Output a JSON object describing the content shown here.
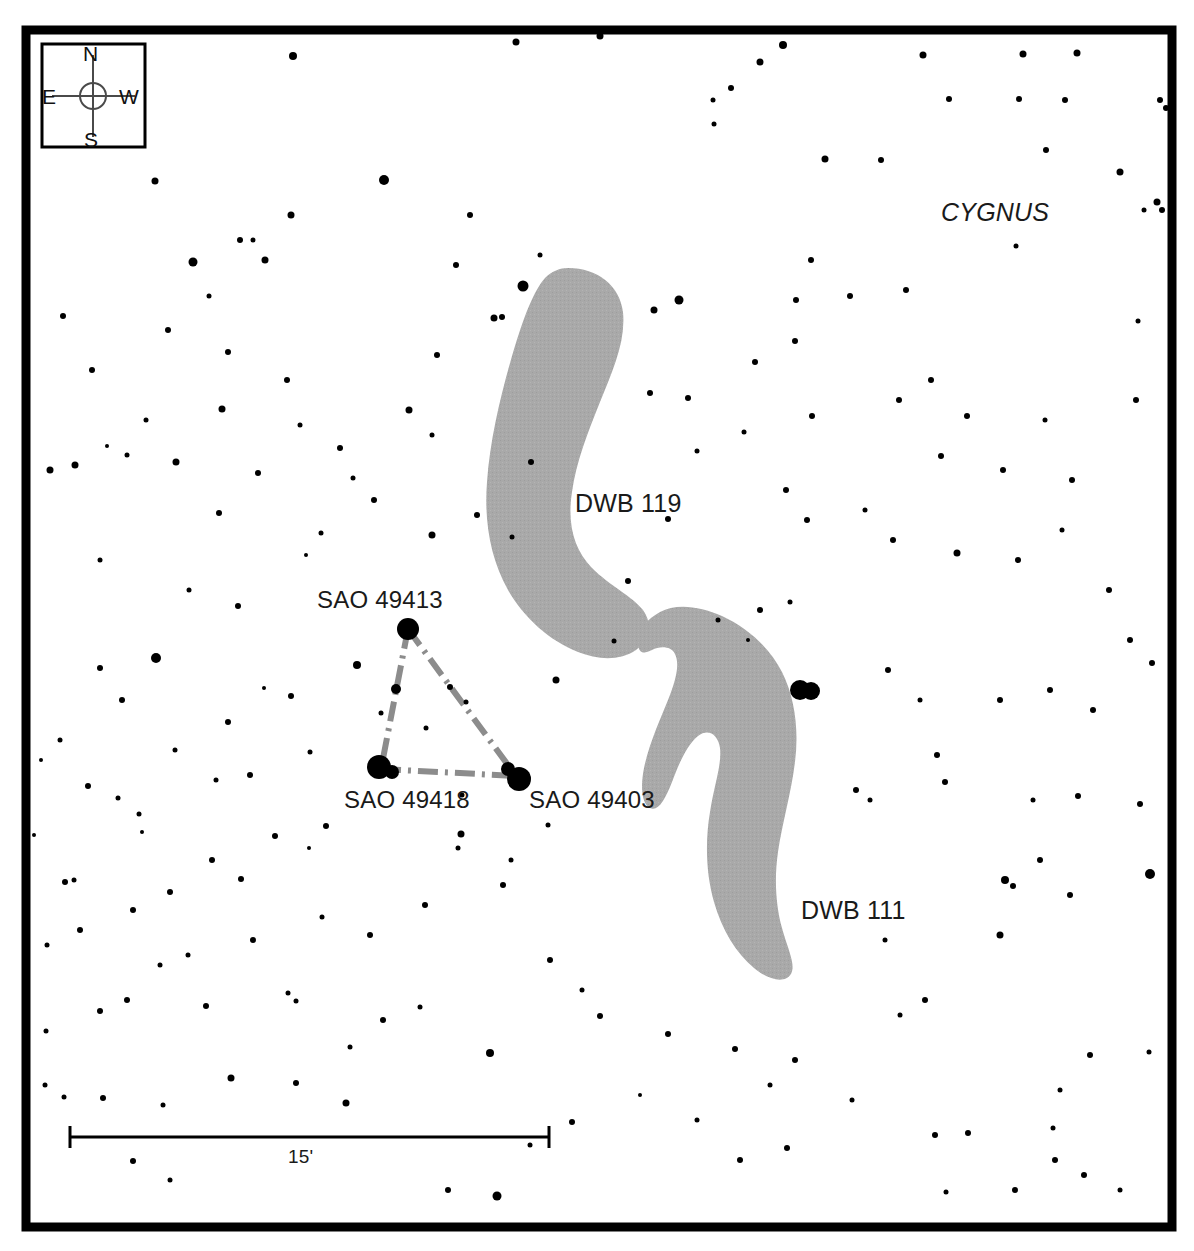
{
  "chart": {
    "type": "star-chart",
    "title_constellation": "CYGNUS",
    "background_color": "#ffffff",
    "frame_color": "#000000",
    "star_color": "#000000",
    "nebula_color": "#a8a8a8",
    "asterism_line_color": "#8c8c8c"
  },
  "compass": {
    "name": "compass-rose",
    "north": "N",
    "south": "S",
    "east": "E",
    "west": "W"
  },
  "scale_bar": {
    "label": "15'",
    "value": 15,
    "unit": "arcminutes",
    "x_start": 70,
    "x_end": 549,
    "y": 1137
  },
  "labels": {
    "constellation": "CYGNUS",
    "nebula_119": "DWB 119",
    "nebula_111": "DWB 111",
    "star_49413": "SAO 49413",
    "star_49418": "SAO 49418",
    "star_49403": "SAO 49403"
  },
  "nebulae": [
    {
      "name": "DWB 119",
      "label": "DWB 119",
      "label_x": 575,
      "label_y": 489
    },
    {
      "name": "DWB 111",
      "label": "DWB 111",
      "label_x": 801,
      "label_y": 896
    }
  ],
  "named_stars": [
    {
      "name": "SAO 49413",
      "x": 408,
      "y": 629,
      "r": 11
    },
    {
      "name": "SAO 49418",
      "x": 381,
      "y": 769,
      "r": 11
    },
    {
      "name": "SAO 49403",
      "x": 516,
      "y": 776,
      "r": 11
    }
  ],
  "asterism": {
    "name": "triangle",
    "vertices": [
      [
        408,
        629
      ],
      [
        381,
        769
      ],
      [
        516,
        776
      ]
    ],
    "style": "dash-dot",
    "closed": true
  },
  "chart_data": {
    "type": "scatter",
    "title": "CYGNUS",
    "xlabel": "",
    "ylabel": "",
    "annotations": [
      "CYGNUS",
      "DWB 119",
      "DWB 111",
      "SAO 49413",
      "SAO 49418",
      "SAO 49403",
      "15'"
    ],
    "stars": [
      [
        293,
        56,
        8
      ],
      [
        600,
        36,
        7
      ],
      [
        783,
        45,
        8
      ],
      [
        516,
        42,
        7
      ],
      [
        1023,
        54,
        7
      ],
      [
        1077,
        53,
        7
      ],
      [
        923,
        55,
        7
      ],
      [
        1160,
        100,
        6
      ],
      [
        1166,
        108,
        6
      ],
      [
        155,
        181,
        7
      ],
      [
        384,
        180,
        10
      ],
      [
        193,
        262,
        9
      ],
      [
        265,
        260,
        7
      ],
      [
        287,
        380,
        6
      ],
      [
        253,
        240,
        5
      ],
      [
        713,
        100,
        5
      ],
      [
        731,
        88,
        6
      ],
      [
        760,
        62,
        7
      ],
      [
        949,
        99,
        6
      ],
      [
        1065,
        100,
        6
      ],
      [
        1019,
        99,
        6
      ],
      [
        714,
        124,
        5
      ],
      [
        456,
        265,
        6
      ],
      [
        523,
        286,
        11
      ],
      [
        679,
        300,
        9
      ],
      [
        825,
        159,
        7
      ],
      [
        881,
        160,
        6
      ],
      [
        1046,
        150,
        6
      ],
      [
        1120,
        172,
        7
      ],
      [
        1157,
        202,
        7
      ],
      [
        1162,
        210,
        6
      ],
      [
        222,
        409,
        7
      ],
      [
        409,
        410,
        7
      ],
      [
        502,
        317,
        6
      ],
      [
        811,
        260,
        6
      ],
      [
        796,
        300,
        6
      ],
      [
        850,
        296,
        6
      ],
      [
        906,
        290,
        6
      ],
      [
        1144,
        210,
        5
      ],
      [
        1136,
        400,
        6
      ],
      [
        1016,
        246,
        5
      ],
      [
        1138,
        321,
        5
      ],
      [
        75,
        465,
        7
      ],
      [
        176,
        462,
        7
      ],
      [
        127,
        455,
        5
      ],
      [
        258,
        473,
        6
      ],
      [
        219,
        513,
        6
      ],
      [
        300,
        425,
        5
      ],
      [
        107,
        446,
        4
      ],
      [
        353,
        478,
        5
      ],
      [
        100,
        560,
        5
      ],
      [
        50,
        470,
        7
      ],
      [
        238,
        606,
        6
      ],
      [
        189,
        590,
        5
      ],
      [
        321,
        533,
        5
      ],
      [
        156,
        658,
        10
      ],
      [
        100,
        668,
        6
      ],
      [
        122,
        700,
        6
      ],
      [
        228,
        722,
        6
      ],
      [
        357,
        665,
        8
      ],
      [
        291,
        696,
        6
      ],
      [
        264,
        688,
        4
      ],
      [
        432,
        535,
        7
      ],
      [
        477,
        515,
        6
      ],
      [
        512,
        537,
        5
      ],
      [
        531,
        462,
        6
      ],
      [
        556,
        680,
        7
      ],
      [
        614,
        641,
        5
      ],
      [
        628,
        581,
        6
      ],
      [
        668,
        519,
        6
      ],
      [
        650,
        393,
        6
      ],
      [
        654,
        310,
        7
      ],
      [
        688,
        398,
        6
      ],
      [
        697,
        451,
        5
      ],
      [
        755,
        362,
        6
      ],
      [
        795,
        341,
        6
      ],
      [
        744,
        432,
        5
      ],
      [
        786,
        490,
        6
      ],
      [
        812,
        416,
        6
      ],
      [
        899,
        400,
        6
      ],
      [
        931,
        380,
        6
      ],
      [
        967,
        416,
        6
      ],
      [
        1045,
        420,
        5
      ],
      [
        941,
        456,
        6
      ],
      [
        1003,
        470,
        6
      ],
      [
        865,
        510,
        5
      ],
      [
        893,
        540,
        6
      ],
      [
        807,
        520,
        6
      ],
      [
        957,
        553,
        7
      ],
      [
        1018,
        560,
        6
      ],
      [
        1062,
        530,
        5
      ],
      [
        1072,
        480,
        6
      ],
      [
        1109,
        590,
        6
      ],
      [
        1130,
        640,
        6
      ],
      [
        1152,
        663,
        6
      ],
      [
        790,
        602,
        5
      ],
      [
        760,
        610,
        6
      ],
      [
        718,
        620,
        5
      ],
      [
        748,
        640,
        4
      ],
      [
        800,
        690,
        9
      ],
      [
        812,
        690,
        8
      ],
      [
        888,
        670,
        6
      ],
      [
        920,
        700,
        5
      ],
      [
        937,
        755,
        6
      ],
      [
        945,
        782,
        6
      ],
      [
        1000,
        700,
        6
      ],
      [
        1050,
        690,
        6
      ],
      [
        1093,
        710,
        6
      ],
      [
        856,
        790,
        6
      ],
      [
        870,
        800,
        5
      ],
      [
        1078,
        796,
        6
      ],
      [
        1033,
        800,
        5
      ],
      [
        1140,
        804,
        6
      ],
      [
        1005,
        880,
        8
      ],
      [
        1040,
        860,
        6
      ],
      [
        1150,
        874,
        10
      ],
      [
        1013,
        886,
        6
      ],
      [
        1070,
        895,
        6
      ],
      [
        885,
        940,
        5
      ],
      [
        1000,
        935,
        7
      ],
      [
        935,
        1135,
        6
      ],
      [
        1090,
        1055,
        6
      ],
      [
        1060,
        1090,
        5
      ],
      [
        1149,
        1052,
        5
      ],
      [
        1055,
        1160,
        6
      ],
      [
        968,
        1133,
        6
      ],
      [
        1053,
        1128,
        5
      ],
      [
        381,
        713,
        5
      ],
      [
        450,
        687,
        6
      ],
      [
        466,
        702,
        5
      ],
      [
        426,
        728,
        5
      ],
      [
        461,
        834,
        7
      ],
      [
        458,
        848,
        5
      ],
      [
        548,
        825,
        5
      ],
      [
        511,
        860,
        5
      ],
      [
        425,
        905,
        6
      ],
      [
        503,
        885,
        6
      ],
      [
        462,
        795,
        5
      ],
      [
        326,
        826,
        6
      ],
      [
        275,
        836,
        6
      ],
      [
        309,
        848,
        4
      ],
      [
        212,
        860,
        6
      ],
      [
        241,
        879,
        6
      ],
      [
        139,
        814,
        5
      ],
      [
        142,
        832,
        4
      ],
      [
        34,
        835,
        4
      ],
      [
        65,
        882,
        6
      ],
      [
        74,
        880,
        5
      ],
      [
        170,
        892,
        6
      ],
      [
        133,
        910,
        6
      ],
      [
        206,
        1006,
        6
      ],
      [
        296,
        1001,
        5
      ],
      [
        127,
        1000,
        6
      ],
      [
        160,
        965,
        5
      ],
      [
        288,
        993,
        5
      ],
      [
        231,
        1078,
        7
      ],
      [
        296,
        1083,
        6
      ],
      [
        346,
        1103,
        7
      ],
      [
        350,
        1047,
        5
      ],
      [
        383,
        1020,
        6
      ],
      [
        420,
        1007,
        5
      ],
      [
        490,
        1053,
        8
      ],
      [
        100,
        1011,
        6
      ],
      [
        103,
        1098,
        6
      ],
      [
        45,
        1085,
        5
      ],
      [
        64,
        1097,
        5
      ],
      [
        163,
        1105,
        5
      ],
      [
        46,
        1031,
        5
      ],
      [
        133,
        1161,
        6
      ],
      [
        170,
        1180,
        5
      ],
      [
        448,
        1190,
        6
      ],
      [
        497,
        1196,
        9
      ],
      [
        600,
        1016,
        6
      ],
      [
        668,
        1034,
        6
      ],
      [
        735,
        1049,
        6
      ],
      [
        770,
        1085,
        5
      ],
      [
        740,
        1160,
        6
      ],
      [
        787,
        1148,
        6
      ],
      [
        795,
        1060,
        6
      ],
      [
        852,
        1100,
        5
      ],
      [
        900,
        1015,
        5
      ],
      [
        925,
        1000,
        6
      ],
      [
        1015,
        1190,
        6
      ],
      [
        1084,
        1175,
        6
      ],
      [
        1120,
        1190,
        5
      ],
      [
        946,
        1192,
        5
      ],
      [
        582,
        990,
        5
      ],
      [
        550,
        960,
        6
      ],
      [
        530,
        1145,
        5
      ],
      [
        572,
        1122,
        6
      ],
      [
        640,
        1095,
        4
      ],
      [
        697,
        1120,
        5
      ],
      [
        253,
        940,
        6
      ],
      [
        322,
        917,
        5
      ],
      [
        370,
        935,
        6
      ],
      [
        188,
        955,
        5
      ],
      [
        80,
        930,
        6
      ],
      [
        47,
        945,
        5
      ],
      [
        60,
        740,
        5
      ],
      [
        41,
        760,
        4
      ],
      [
        88,
        786,
        6
      ],
      [
        118,
        798,
        5
      ],
      [
        216,
        780,
        5
      ],
      [
        250,
        775,
        6
      ],
      [
        175,
        750,
        5
      ],
      [
        310,
        752,
        5
      ],
      [
        306,
        555,
        4
      ],
      [
        374,
        500,
        6
      ],
      [
        340,
        448,
        6
      ],
      [
        228,
        352,
        6
      ],
      [
        168,
        330,
        6
      ],
      [
        209,
        296,
        5
      ],
      [
        63,
        316,
        6
      ],
      [
        92,
        370,
        6
      ],
      [
        146,
        420,
        5
      ],
      [
        291,
        215,
        7
      ],
      [
        240,
        240,
        6
      ],
      [
        437,
        355,
        6
      ],
      [
        470,
        215,
        6
      ],
      [
        494,
        318,
        7
      ],
      [
        540,
        255,
        5
      ],
      [
        432,
        435,
        5
      ]
    ]
  }
}
